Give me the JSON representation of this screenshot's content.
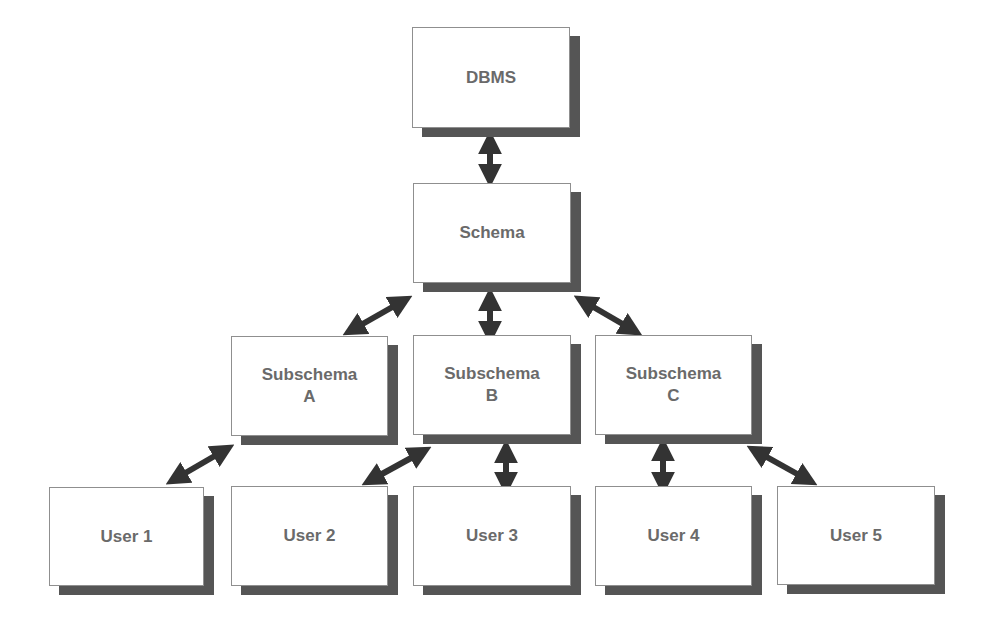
{
  "diagram": {
    "title": "",
    "nodes": {
      "dbms": {
        "label": "DBMS"
      },
      "schema": {
        "label": "Schema"
      },
      "subschema_a": {
        "label": "Subschema\nA"
      },
      "subschema_b": {
        "label": "Subschema\nB"
      },
      "subschema_c": {
        "label": "Subschema\nC"
      },
      "user_1": {
        "label": "User 1"
      },
      "user_2": {
        "label": "User 2"
      },
      "user_3": {
        "label": "User 3"
      },
      "user_4": {
        "label": "User 4"
      },
      "user_5": {
        "label": "User 5"
      }
    },
    "edges": [
      {
        "from": "DBMS",
        "to": "Schema",
        "type": "bidirectional"
      },
      {
        "from": "Schema",
        "to": "Subschema A",
        "type": "bidirectional"
      },
      {
        "from": "Schema",
        "to": "Subschema B",
        "type": "bidirectional"
      },
      {
        "from": "Schema",
        "to": "Subschema C",
        "type": "bidirectional"
      },
      {
        "from": "Subschema A",
        "to": "User 1",
        "type": "bidirectional"
      },
      {
        "from": "Subschema B",
        "to": "User 2",
        "type": "bidirectional"
      },
      {
        "from": "Subschema B",
        "to": "User 3",
        "type": "bidirectional"
      },
      {
        "from": "Subschema C",
        "to": "User 4",
        "type": "bidirectional"
      },
      {
        "from": "Subschema C",
        "to": "User 5",
        "type": "bidirectional"
      }
    ],
    "colors": {
      "box_fill": "#ffffff",
      "box_border": "#8f8f8f",
      "shadow": "#555555",
      "text": "#6a6a6a",
      "arrow": "#333333"
    }
  }
}
